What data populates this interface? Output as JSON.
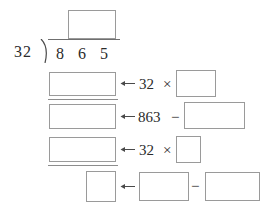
{
  "worksheet": {
    "type": "long-division-practice",
    "problem": {
      "divisor": "32",
      "dividend_digits": [
        "8",
        "6",
        "5"
      ],
      "dividend": "865",
      "quotient": "",
      "bracket_icon": "division-bracket-icon"
    },
    "steps": [
      {
        "id": "step-1",
        "left_box_value": "",
        "arrow_icon": "left-arrow-icon",
        "expression_prefix": "32",
        "operator": "×",
        "operator_name": "multiplication-sign",
        "right_box_value": "",
        "underline": true
      },
      {
        "id": "step-2",
        "left_box_value": "",
        "arrow_icon": "left-arrow-icon",
        "expression_prefix": "863",
        "operator": "−",
        "operator_name": "minus-sign",
        "right_box_value": "",
        "underline": false
      },
      {
        "id": "step-3",
        "left_box_value": "",
        "arrow_icon": "left-arrow-icon",
        "expression_prefix": "32",
        "operator": "×",
        "operator_name": "multiplication-sign",
        "right_box_value": "",
        "underline": true
      }
    ],
    "remainder_row": {
      "id": "step-4",
      "result_box_value": "",
      "arrow_icon": "left-arrow-icon",
      "minuend_box_value": "",
      "operator": "−",
      "operator_name": "minus-sign",
      "subtrahend_box_value": ""
    },
    "colors": {
      "background": "#ffffff",
      "ink": "#2b2b2b",
      "box_border": "#9a9a9a",
      "rule": "#8d8d8d"
    }
  }
}
